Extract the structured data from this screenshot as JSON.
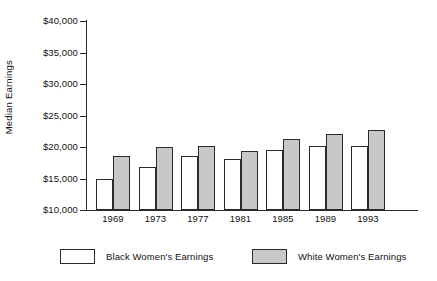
{
  "chart_data": {
    "type": "bar",
    "title": "",
    "subtitle": "",
    "xlabel": "",
    "ylabel": "Median Earnings",
    "categories": [
      "1969",
      "1973",
      "1977",
      "1981",
      "1985",
      "1989",
      "1993"
    ],
    "ylim": [
      10000,
      40000
    ],
    "ytick_values": [
      10000,
      15000,
      20000,
      25000,
      30000,
      35000,
      40000
    ],
    "ytick_labels": [
      "$10,000",
      "$15,000",
      "$20,000",
      "$25,000",
      "$30,000",
      "$35,000",
      "$40,000"
    ],
    "grid": false,
    "legend_position": "bottom",
    "series": [
      {
        "name": "Black Women's Earnings",
        "color": "#ffffff",
        "values": [
          15000,
          16800,
          18500,
          18100,
          19600,
          20200,
          20200
        ]
      },
      {
        "name": "White Women's Earnings",
        "color": "#c8c8c8",
        "values": [
          18600,
          20000,
          20100,
          19400,
          21300,
          22000,
          22700
        ]
      }
    ]
  },
  "legend": {
    "entries": [
      {
        "label": "Black Women's Earnings",
        "swatch": "black-series"
      },
      {
        "label": "White Women's Earnings",
        "swatch": "white-series"
      }
    ]
  },
  "colors": {
    "axis": "#2b2b2b",
    "black_series_fill": "#ffffff",
    "white_series_fill": "#c8c8c8",
    "background": "#ffffff",
    "text": "#111111"
  }
}
